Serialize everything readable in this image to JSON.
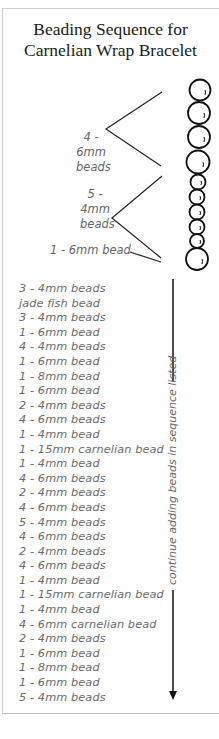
{
  "title": {
    "line1": "Beading Sequence for",
    "line2": "Carnelian Wrap Bracelet"
  },
  "diagram": {
    "group1_label": [
      "4 -",
      "6mm",
      "beads"
    ],
    "group2_label": [
      "5 -",
      "4mm",
      "beads"
    ],
    "single_label": "1 - 6mm bead",
    "beads": [
      {
        "size": "6mm",
        "count": 4
      },
      {
        "size": "4mm",
        "count": 5
      },
      {
        "size": "6mm",
        "count": 1
      }
    ],
    "arrow_text": "continue adding beads in sequence listed",
    "line_color": "#111111",
    "label_color": "#666666"
  },
  "sequence": [
    "3 - 4mm beads",
    "jade fish bead",
    "3 - 4mm beads",
    "1 - 6mm bead",
    "4 - 4mm beads",
    "1 - 6mm bead",
    "1 - 8mm bead",
    "1 - 6mm bead",
    "2 - 4mm beads",
    "4 - 6mm beads",
    "1 - 4mm bead",
    "1 - 15mm carnelian bead",
    "1 - 4mm bead",
    "4 - 6mm beads",
    "2 - 4mm beads",
    "4 - 6mm beads",
    "5 - 4mm beads",
    "4 - 6mm beads",
    "2 - 4mm beads",
    "4 - 6mm beads",
    "1 - 4mm bead",
    "1 - 15mm carnelian bead",
    "1 - 4mm bead",
    "4 - 6mm carnelian bead",
    "2 - 4mm beads",
    "1 - 6mm bead",
    "1 - 8mm bead",
    "1 - 6mm bead",
    "5 - 4mm beads"
  ]
}
